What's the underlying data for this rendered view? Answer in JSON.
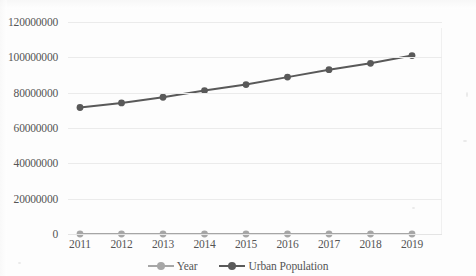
{
  "chart_data": {
    "type": "line",
    "title": "",
    "subtitle": "",
    "xlabel": "",
    "ylabel": "",
    "categories": [
      "2011",
      "2012",
      "2013",
      "2014",
      "2015",
      "2016",
      "2017",
      "2018",
      "2019"
    ],
    "x": [
      2011,
      2012,
      2013,
      2014,
      2015,
      2016,
      2017,
      2018,
      2019
    ],
    "series": [
      {
        "name": "Year",
        "color": "#a6a6a6",
        "marker": "circle",
        "values": [
          2011,
          2012,
          2013,
          2014,
          2015,
          2016,
          2017,
          2018,
          2019
        ]
      },
      {
        "name": "Urban Population",
        "color": "#595959",
        "marker": "circle",
        "values": [
          71600000,
          74200000,
          77400000,
          81200000,
          84600000,
          88800000,
          93000000,
          96600000,
          101000000
        ]
      }
    ],
    "ylim": [
      0,
      120000000
    ],
    "ytick_values": [
      0,
      20000000,
      40000000,
      60000000,
      80000000,
      100000000,
      120000000
    ],
    "ytick_labels": [
      "0",
      "20000000",
      "40000000",
      "60000000",
      "80000000",
      "100000000",
      "120000000"
    ],
    "grid": true,
    "grid_axis": "y",
    "legend_position": "bottom",
    "background_color": "#fdfdfd",
    "gridline_color": "#ebebeb"
  },
  "legend": {
    "items": [
      {
        "label": "Year",
        "color": "#a6a6a6"
      },
      {
        "label": "Urban Population",
        "color": "#595959"
      }
    ]
  }
}
